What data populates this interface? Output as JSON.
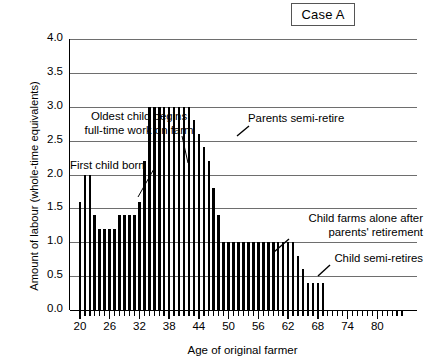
{
  "badge": {
    "label": "Case A"
  },
  "axes": {
    "ylabel": "Amount of labour (whole-time equivalents)",
    "xlabel": "Age of original farmer",
    "yticks": [
      "0.0",
      "0.5",
      "1.0",
      "1.5",
      "2.0",
      "2.5",
      "3.0",
      "3.5",
      "4.0"
    ],
    "xticks": [
      "20",
      "26",
      "32",
      "38",
      "44",
      "50",
      "56",
      "62",
      "68",
      "74",
      "80"
    ]
  },
  "annotations": {
    "oldest_child_line1": "Oldest child begins",
    "oldest_child_line2": "full-time work on farm",
    "first_child": "First child born",
    "parents_semi_retire": "Parents semi-retire",
    "child_farms_line1": "Child farms alone after",
    "child_farms_line2": "parents' retirement",
    "child_semi_retires": "Child semi-retires"
  },
  "colors": {
    "bar": "#000000",
    "grid": "#6e6e6e",
    "axis": "#000000",
    "background": "#ffffff"
  },
  "chart_data": {
    "type": "bar",
    "title": "Case A",
    "xlabel": "Age of original farmer",
    "ylabel": "Amount of labour (whole-time equivalents)",
    "ylim": [
      0,
      4
    ],
    "xlim": [
      18,
      88
    ],
    "grid": true,
    "legend": null,
    "categories": [
      20,
      21,
      22,
      23,
      24,
      25,
      26,
      27,
      28,
      29,
      30,
      31,
      32,
      33,
      34,
      35,
      36,
      37,
      38,
      39,
      40,
      41,
      42,
      43,
      44,
      45,
      46,
      47,
      48,
      49,
      50,
      51,
      52,
      53,
      54,
      55,
      56,
      57,
      58,
      59,
      60,
      61,
      62,
      63,
      64,
      65,
      66,
      67,
      68,
      69,
      70,
      71,
      72,
      73,
      74,
      75,
      76,
      77,
      78,
      79,
      80,
      81,
      82,
      83,
      84,
      85
    ],
    "values": [
      1.6,
      2.0,
      2.0,
      1.4,
      1.2,
      1.2,
      1.2,
      1.2,
      1.4,
      1.4,
      1.4,
      1.4,
      1.6,
      2.2,
      3.0,
      3.0,
      3.0,
      3.0,
      3.0,
      3.0,
      3.0,
      3.0,
      3.0,
      2.8,
      2.6,
      2.4,
      2.2,
      1.8,
      1.4,
      1.0,
      1.0,
      1.0,
      1.0,
      1.0,
      1.0,
      1.0,
      1.0,
      1.0,
      1.0,
      1.0,
      1.0,
      1.0,
      1.0,
      1.0,
      0.8,
      0.6,
      0.4,
      0.4,
      0.4,
      0.4,
      0,
      0,
      0,
      0,
      0,
      0,
      0,
      0,
      0,
      0,
      0,
      0,
      0,
      0,
      0,
      0
    ],
    "annotations": [
      {
        "text": "Oldest child begins full-time work on farm",
        "points_to_age": 33
      },
      {
        "text": "First child born",
        "points_to_age": 23
      },
      {
        "text": "Parents semi-retire",
        "points_to_age": 44
      },
      {
        "text": "Child farms alone after parents' retirement",
        "points_to_age": 50
      },
      {
        "text": "Child semi-retires",
        "points_to_age": 65
      }
    ]
  }
}
